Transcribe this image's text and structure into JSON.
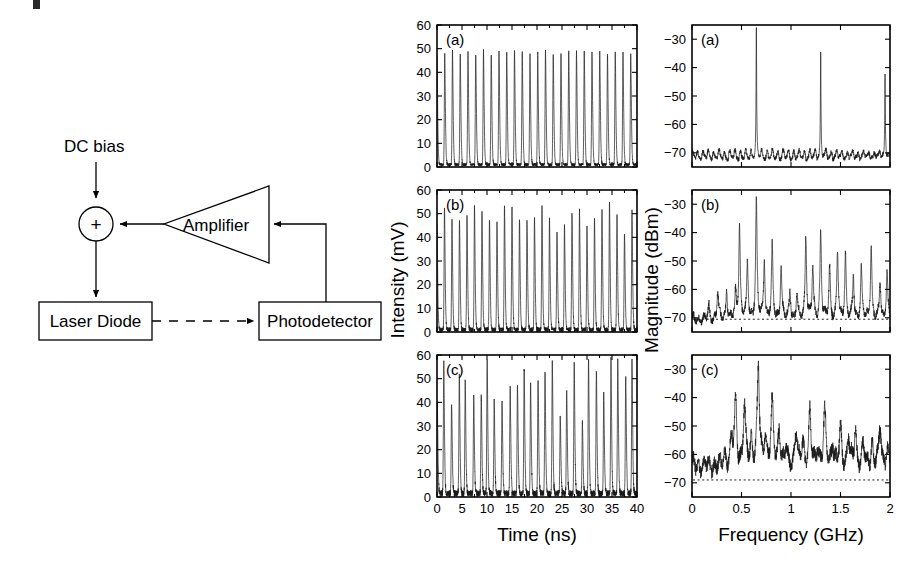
{
  "figure": {
    "background_color": "#ffffff",
    "trace_color": "#1a1a1a"
  },
  "schematic": {
    "name": "optoelectronic-feedback-loop",
    "nodes": {
      "dc_bias_label": "DC bias",
      "summing_junction_symbol": "+",
      "laser_diode_label": "Laser Diode",
      "photodetector_label": "Photodetector",
      "amplifier_label": "Amplifier"
    },
    "connections": [
      {
        "from": "DC bias",
        "to": "summing junction",
        "style": "solid-arrow"
      },
      {
        "from": "summing junction",
        "to": "Laser Diode",
        "style": "solid-arrow"
      },
      {
        "from": "Laser Diode",
        "to": "Photodetector",
        "style": "dashed-arrow"
      },
      {
        "from": "Photodetector",
        "to": "Amplifier",
        "style": "solid-arrow"
      },
      {
        "from": "Amplifier",
        "to": "summing junction",
        "style": "solid-arrow"
      }
    ]
  },
  "chart_data": [
    {
      "id": "timeseries-a",
      "type": "line",
      "panel_label": "(a)",
      "xlabel": "Time (ns)",
      "ylabel": "Intensity (mV)",
      "xlim": [
        0,
        40
      ],
      "ylim": [
        0,
        60
      ],
      "xticks": [
        0,
        5,
        10,
        15,
        20,
        25,
        30,
        35,
        40
      ],
      "xticklabels": [
        "0",
        "5",
        "10",
        "15",
        "20",
        "25",
        "30",
        "35",
        "40"
      ],
      "yticks": [
        0,
        10,
        20,
        30,
        40,
        50,
        60
      ],
      "yticklabels": [
        "0",
        "10",
        "20",
        "30",
        "40",
        "50",
        "60"
      ],
      "grid": false,
      "legend": "none",
      "description": "Regular period-one pulsing oscillation, peaks near 48-50 mV, troughs near 1 mV, period about 1.55 ns (0.65 GHz)",
      "waveform": {
        "kind": "pulsing",
        "period_ns": 1.55,
        "peak_mV": 48.5,
        "trough_mV": 1.0,
        "peak_jitter_mV": 1.2,
        "amplitude_modulation": 0.0,
        "noise_mV": 0.6,
        "seed": 11
      }
    },
    {
      "id": "timeseries-b",
      "type": "line",
      "panel_label": "(b)",
      "xlabel": "Time (ns)",
      "ylabel": "Intensity (mV)",
      "xlim": [
        0,
        40
      ],
      "ylim": [
        0,
        60
      ],
      "xticks": [
        0,
        5,
        10,
        15,
        20,
        25,
        30,
        35,
        40
      ],
      "xticklabels": [
        "0",
        "5",
        "10",
        "15",
        "20",
        "25",
        "30",
        "35",
        "40"
      ],
      "yticks": [
        0,
        10,
        20,
        30,
        40,
        50,
        60
      ],
      "yticklabels": [
        "0",
        "10",
        "20",
        "30",
        "40",
        "50",
        "60"
      ],
      "grid": false,
      "legend": "none",
      "description": "Quasi-periodic pulsing with slowly varying peak heights between about 42 and 54 mV",
      "waveform": {
        "kind": "pulsing",
        "period_ns": 1.5,
        "peak_mV": 49.0,
        "trough_mV": 1.0,
        "peak_jitter_mV": 3.0,
        "amplitude_modulation": 0.09,
        "modulation_period_ns": 6.5,
        "noise_mV": 0.9,
        "seed": 27
      }
    },
    {
      "id": "timeseries-c",
      "type": "line",
      "panel_label": "(c)",
      "xlabel": "Time (ns)",
      "ylabel": "Intensity (mV)",
      "xlim": [
        0,
        40
      ],
      "ylim": [
        0,
        60
      ],
      "xticks": [
        0,
        5,
        10,
        15,
        20,
        25,
        30,
        35,
        40
      ],
      "xticklabels": [
        "0",
        "5",
        "10",
        "15",
        "20",
        "25",
        "30",
        "35",
        "40"
      ],
      "yticks": [
        0,
        10,
        20,
        30,
        40,
        50,
        60
      ],
      "yticklabels": [
        "0",
        "10",
        "20",
        "30",
        "40",
        "50",
        "60"
      ],
      "grid": false,
      "legend": "none",
      "description": "Chaotic pulsing with strongly irregular peak heights ranging roughly 28 to 58 mV and irregular spacing",
      "waveform": {
        "kind": "pulsing",
        "period_ns": 1.45,
        "peak_mV": 50.0,
        "trough_mV": 1.5,
        "peak_jitter_mV": 11.0,
        "amplitude_modulation": 0.16,
        "modulation_period_ns": 4.3,
        "timing_jitter_ns": 0.16,
        "noise_mV": 1.3,
        "seed": 43
      }
    },
    {
      "id": "spectrum-a",
      "type": "line",
      "panel_label": "(a)",
      "xlabel": "Frequency (GHz)",
      "ylabel": "Magnitude (dBm)",
      "xlim": [
        0,
        2
      ],
      "ylim": [
        -75,
        -25
      ],
      "xticks": [
        0,
        0.5,
        1,
        1.5,
        2
      ],
      "xticklabels": [
        "0",
        "0.5",
        "1",
        "1.5",
        "2"
      ],
      "yticks": [
        -70,
        -60,
        -50,
        -40,
        -30
      ],
      "yticklabels": [
        "-70",
        "-60",
        "-50",
        "-40",
        "-30"
      ],
      "grid": false,
      "legend": "none",
      "description": "Period-one spectrum: sharp fundamental and harmonics over a flat noise floor near -71 dBm",
      "noise_floor_dBm": -71.5,
      "noise_ripple_dBm": 1.3,
      "peaks": [
        {
          "frequency_GHz": 0.65,
          "magnitude_dBm": -27.5
        },
        {
          "frequency_GHz": 1.3,
          "magnitude_dBm": -37.0
        },
        {
          "frequency_GHz": 1.95,
          "magnitude_dBm": -41.5
        }
      ],
      "reference_line_dBm": null
    },
    {
      "id": "spectrum-b",
      "type": "line",
      "panel_label": "(b)",
      "xlabel": "Frequency (GHz)",
      "ylabel": "Magnitude (dBm)",
      "xlim": [
        0,
        2
      ],
      "ylim": [
        -75,
        -25
      ],
      "xticks": [
        0,
        0.5,
        1,
        1.5,
        2
      ],
      "xticklabels": [
        "0",
        "0.5",
        "1",
        "1.5",
        "2"
      ],
      "yticks": [
        -70,
        -60,
        -50,
        -40,
        -30
      ],
      "yticklabels": [
        "-70",
        "-60",
        "-50",
        "-40",
        "-30"
      ],
      "grid": false,
      "legend": "none",
      "description": "Quasi-periodic spectrum: dense comb of sidebands, dominant peak at 0.65 GHz near -29 dBm, noise floor about -70.5 dBm",
      "noise_floor_dBm": -70.5,
      "noise_ripple_dBm": 2.2,
      "peaks": [
        {
          "frequency_GHz": 0.17,
          "magnitude_dBm": -66.0
        },
        {
          "frequency_GHz": 0.26,
          "magnitude_dBm": -60.5
        },
        {
          "frequency_GHz": 0.35,
          "magnitude_dBm": -60.0
        },
        {
          "frequency_GHz": 0.44,
          "magnitude_dBm": -62.0
        },
        {
          "frequency_GHz": 0.48,
          "magnitude_dBm": -38.0
        },
        {
          "frequency_GHz": 0.56,
          "magnitude_dBm": -51.0
        },
        {
          "frequency_GHz": 0.65,
          "magnitude_dBm": -29.0
        },
        {
          "frequency_GHz": 0.73,
          "magnitude_dBm": -50.0
        },
        {
          "frequency_GHz": 0.81,
          "magnitude_dBm": -45.5
        },
        {
          "frequency_GHz": 0.9,
          "magnitude_dBm": -51.0
        },
        {
          "frequency_GHz": 0.99,
          "magnitude_dBm": -60.0
        },
        {
          "frequency_GHz": 1.06,
          "magnitude_dBm": -62.0
        },
        {
          "frequency_GHz": 1.15,
          "magnitude_dBm": -40.5
        },
        {
          "frequency_GHz": 1.22,
          "magnitude_dBm": -52.0
        },
        {
          "frequency_GHz": 1.3,
          "magnitude_dBm": -39.5
        },
        {
          "frequency_GHz": 1.39,
          "magnitude_dBm": -52.5
        },
        {
          "frequency_GHz": 1.47,
          "magnitude_dBm": -46.5
        },
        {
          "frequency_GHz": 1.55,
          "magnitude_dBm": -47.5
        },
        {
          "frequency_GHz": 1.63,
          "magnitude_dBm": -56.0
        },
        {
          "frequency_GHz": 1.71,
          "magnitude_dBm": -52.0
        },
        {
          "frequency_GHz": 1.81,
          "magnitude_dBm": -44.5
        },
        {
          "frequency_GHz": 1.9,
          "magnitude_dBm": -58.0
        },
        {
          "frequency_GHz": 1.97,
          "magnitude_dBm": -53.0
        }
      ],
      "reference_line_dBm": -70.5
    },
    {
      "id": "spectrum-c",
      "type": "line",
      "panel_label": "(c)",
      "xlabel": "Frequency (GHz)",
      "ylabel": "Magnitude (dBm)",
      "xlim": [
        0,
        2
      ],
      "ylim": [
        -75,
        -25
      ],
      "xticks": [
        0,
        0.5,
        1,
        1.5,
        2
      ],
      "xticklabels": [
        "0",
        "0.5",
        "1",
        "1.5",
        "2"
      ],
      "yticks": [
        -70,
        -60,
        -50,
        -40,
        -30
      ],
      "yticklabels": [
        "-70",
        "-60",
        "-50",
        "-40",
        "-30"
      ],
      "grid": false,
      "legend": "none",
      "description": "Chaotic broadband spectrum: elevated continuous pedestal near -63 dBm with broadened peaks, dominant at 0.67 GHz near -30 dBm",
      "noise_floor_dBm": -64.0,
      "noise_ripple_dBm": 4.0,
      "peaks": [
        {
          "frequency_GHz": 0.1,
          "magnitude_dBm": -66.0
        },
        {
          "frequency_GHz": 0.22,
          "magnitude_dBm": -67.0
        },
        {
          "frequency_GHz": 0.33,
          "magnitude_dBm": -60.0
        },
        {
          "frequency_GHz": 0.4,
          "magnitude_dBm": -56.0
        },
        {
          "frequency_GHz": 0.44,
          "magnitude_dBm": -41.0
        },
        {
          "frequency_GHz": 0.53,
          "magnitude_dBm": -44.0
        },
        {
          "frequency_GHz": 0.6,
          "magnitude_dBm": -55.0
        },
        {
          "frequency_GHz": 0.67,
          "magnitude_dBm": -30.0
        },
        {
          "frequency_GHz": 0.74,
          "magnitude_dBm": -53.0
        },
        {
          "frequency_GHz": 0.81,
          "magnitude_dBm": -43.0
        },
        {
          "frequency_GHz": 0.88,
          "magnitude_dBm": -51.0
        },
        {
          "frequency_GHz": 0.95,
          "magnitude_dBm": -58.0
        },
        {
          "frequency_GHz": 1.05,
          "magnitude_dBm": -52.0
        },
        {
          "frequency_GHz": 1.12,
          "magnitude_dBm": -56.0
        },
        {
          "frequency_GHz": 1.19,
          "magnitude_dBm": -46.0
        },
        {
          "frequency_GHz": 1.27,
          "magnitude_dBm": -57.0
        },
        {
          "frequency_GHz": 1.34,
          "magnitude_dBm": -45.0
        },
        {
          "frequency_GHz": 1.42,
          "magnitude_dBm": -56.0
        },
        {
          "frequency_GHz": 1.5,
          "magnitude_dBm": -52.0
        },
        {
          "frequency_GHz": 1.58,
          "magnitude_dBm": -54.0
        },
        {
          "frequency_GHz": 1.65,
          "magnitude_dBm": -52.0
        },
        {
          "frequency_GHz": 1.73,
          "magnitude_dBm": -57.0
        },
        {
          "frequency_GHz": 1.82,
          "magnitude_dBm": -56.0
        },
        {
          "frequency_GHz": 1.9,
          "magnitude_dBm": -50.5
        },
        {
          "frequency_GHz": 1.97,
          "magnitude_dBm": -58.0
        }
      ],
      "reference_line_dBm": -69.0
    }
  ]
}
